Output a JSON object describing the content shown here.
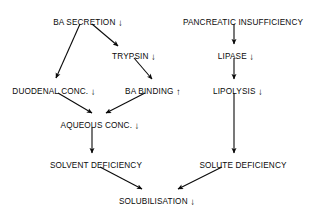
{
  "diagram": {
    "type": "flowchart",
    "background_color": "#ffffff",
    "text_color": "#0a0a0a",
    "arrow_color": "#0a0a0a",
    "nodes": [
      {
        "id": "ba-secretion",
        "label": "BA SECRETION",
        "trend": "↓",
        "trend_name": "down-arrow-icon",
        "x": 88,
        "y": 18
      },
      {
        "id": "trypsin",
        "label": "TRYPSIN",
        "trend": "↓",
        "trend_name": "down-arrow-icon",
        "x": 134,
        "y": 52
      },
      {
        "id": "duodenal-conc",
        "label": "DUODENAL CONC.",
        "trend": "↓",
        "trend_name": "down-arrow-icon",
        "x": 54,
        "y": 87
      },
      {
        "id": "ba-binding",
        "label": "BA BINDING",
        "trend": "↑",
        "trend_name": "up-arrow-icon",
        "x": 153,
        "y": 87
      },
      {
        "id": "aqueous-conc",
        "label": "AQUEOUS CONC.",
        "trend": "↓",
        "trend_name": "down-arrow-icon",
        "x": 100,
        "y": 121
      },
      {
        "id": "solvent-deficiency",
        "label": "SOLVENT DEFICIENCY",
        "trend": "",
        "trend_name": "",
        "x": 96,
        "y": 161
      },
      {
        "id": "solubilisation",
        "label": "SOLUBILISATION",
        "trend": "↓",
        "trend_name": "down-arrow-icon",
        "x": 157,
        "y": 197
      },
      {
        "id": "pancreatic-insufficiency",
        "label": "PANCREATIC INSUFFICIENCY",
        "trend": "",
        "trend_name": "",
        "x": 243,
        "y": 18
      },
      {
        "id": "lipase",
        "label": "LIPASE",
        "trend": "↓",
        "trend_name": "down-arrow-icon",
        "x": 236,
        "y": 52
      },
      {
        "id": "lipolysis",
        "label": "LIPOLYSIS",
        "trend": "↓",
        "trend_name": "down-arrow-icon",
        "x": 238,
        "y": 87
      },
      {
        "id": "solute-deficiency",
        "label": "SOLUTE DEFICIENCY",
        "trend": "",
        "trend_name": "",
        "x": 243,
        "y": 161
      }
    ],
    "edges": [
      {
        "id": "ba-secretion-to-duodenal-conc",
        "from": "ba-secretion",
        "to": "duodenal-conc",
        "x1": 80,
        "y1": 24,
        "x2": 56,
        "y2": 78
      },
      {
        "id": "ba-secretion-to-trypsin",
        "from": "ba-secretion",
        "to": "trypsin",
        "x1": 92,
        "y1": 24,
        "x2": 118,
        "y2": 46
      },
      {
        "id": "trypsin-to-ba-binding",
        "from": "trypsin",
        "to": "ba-binding",
        "x1": 134,
        "y1": 58,
        "x2": 152,
        "y2": 79
      },
      {
        "id": "duodenal-conc-to-aqueous-conc",
        "from": "duodenal-conc",
        "to": "aqueous-conc",
        "x1": 58,
        "y1": 93,
        "x2": 92,
        "y2": 113
      },
      {
        "id": "ba-binding-to-aqueous-conc",
        "from": "ba-binding",
        "to": "aqueous-conc",
        "x1": 145,
        "y1": 93,
        "x2": 106,
        "y2": 113
      },
      {
        "id": "aqueous-conc-to-solvent-deficiency",
        "from": "aqueous-conc",
        "to": "solvent-deficiency",
        "x1": 92,
        "y1": 127,
        "x2": 92,
        "y2": 153
      },
      {
        "id": "solvent-deficiency-to-solubilisation",
        "from": "solvent-deficiency",
        "to": "solubilisation",
        "x1": 100,
        "y1": 167,
        "x2": 142,
        "y2": 189
      },
      {
        "id": "pancreatic-insufficiency-to-lipase",
        "from": "pancreatic-insufficiency",
        "to": "lipase",
        "x1": 234,
        "y1": 24,
        "x2": 234,
        "y2": 44
      },
      {
        "id": "lipase-to-lipolysis",
        "from": "lipase",
        "to": "lipolysis",
        "x1": 234,
        "y1": 58,
        "x2": 234,
        "y2": 79
      },
      {
        "id": "lipolysis-to-solute-deficiency",
        "from": "lipolysis",
        "to": "solute-deficiency",
        "x1": 234,
        "y1": 93,
        "x2": 234,
        "y2": 153
      },
      {
        "id": "solute-deficiency-to-solubilisation",
        "from": "solute-deficiency",
        "to": "solubilisation",
        "x1": 222,
        "y1": 167,
        "x2": 178,
        "y2": 189
      }
    ]
  }
}
